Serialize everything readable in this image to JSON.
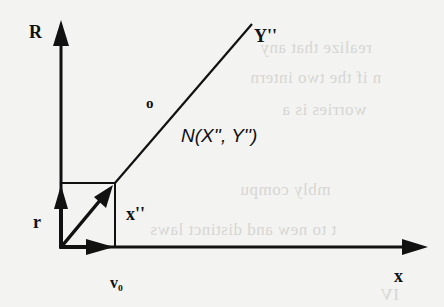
{
  "diagram": {
    "type": "vector-decomposition-on-axes",
    "labels": {
      "vertical_axis": "R",
      "horizontal_axis": "x",
      "line_end": "Y''",
      "line_mark": "o",
      "point": "N(X'', Y'')",
      "vertical_component": "r",
      "box_side": "x''",
      "horizontal_component": "v₀"
    },
    "colors": {
      "ink": "#111111",
      "paper": "#f3f3f1",
      "bleed_through": "#d6d6d3"
    }
  },
  "bleed_through_text": [
    "realize that any",
    "n if the two intern",
    "worries is a",
    "mbly compu",
    "t to new and distinct laws",
    "IV"
  ]
}
